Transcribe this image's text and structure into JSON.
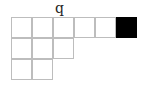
{
  "diagram": {
    "label": "q",
    "cell_size": 21,
    "origin": {
      "x": 11,
      "y": 17
    },
    "rows": [
      {
        "cells": [
          0,
          0,
          0,
          0,
          0,
          1
        ]
      },
      {
        "cells": [
          0,
          0,
          0
        ]
      },
      {
        "cells": [
          0,
          0
        ]
      }
    ],
    "colors": {
      "border": "#bdbdbd",
      "filled": "#000000",
      "empty": "#ffffff"
    }
  }
}
